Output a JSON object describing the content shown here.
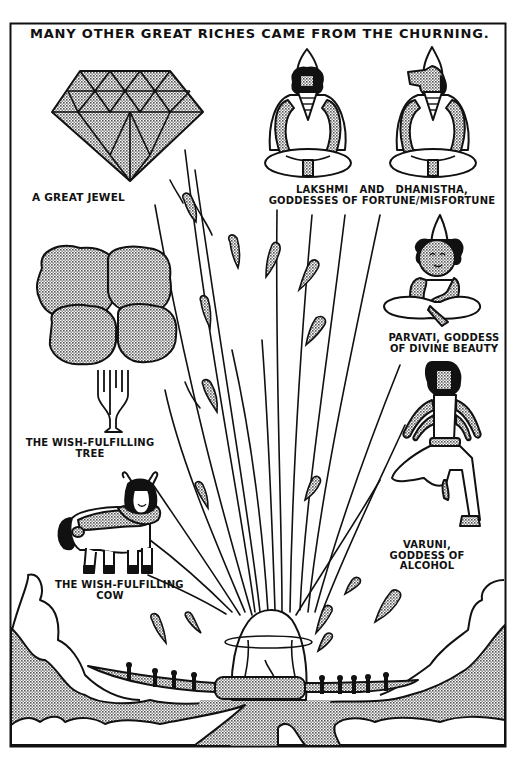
{
  "panel": {
    "title": "MANY OTHER GREAT RICHES CAME FROM THE CHURNING.",
    "colors": {
      "ink": "#111111",
      "paper": "#ffffff",
      "halftone": "#9a9a9a"
    }
  },
  "captions": {
    "jewel": "A GREAT JEWEL",
    "lakshmi": "LAKSHMI   AND   DHANISTHA,\nGODDESSES OF FORTUNE/MISFORTUNE",
    "parvati": "PARVATI, GODDESS\nOF DIVINE BEAUTY",
    "tree": "THE WISH-FULFILLING\nTREE",
    "cow": "THE WISH-FULFILLING\nCOW",
    "varuni": "VARUNI,\nGODDESS OF\nALCOHOL"
  },
  "figures": [
    {
      "name": "great-jewel",
      "kind": "gem"
    },
    {
      "name": "lakshmi",
      "kind": "seated-goddess"
    },
    {
      "name": "dhanistha",
      "kind": "seated-goddess-crocodile-head"
    },
    {
      "name": "parvati",
      "kind": "seated-goddess"
    },
    {
      "name": "varuni",
      "kind": "standing-four-armed-goddess"
    },
    {
      "name": "wish-fulfilling-tree",
      "kind": "tree"
    },
    {
      "name": "wish-fulfilling-cow",
      "kind": "cow-with-woman-face"
    },
    {
      "name": "churning-mountain",
      "kind": "mountain-with-serpent-and-churners"
    }
  ]
}
